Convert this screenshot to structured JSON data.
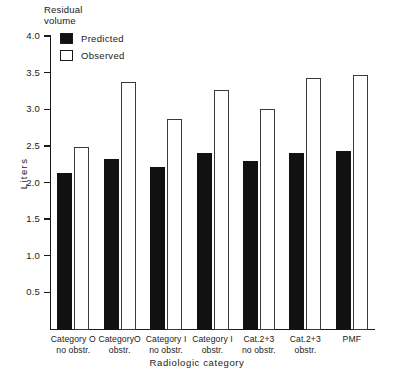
{
  "chart_data": {
    "type": "bar",
    "title": "Residual volume",
    "xlabel": "Radiologic category",
    "ylabel": "Liters",
    "ylim": [
      0,
      4.0
    ],
    "yticks": [
      "0.5",
      "1.0",
      "1.5",
      "2.0",
      "2.5",
      "3.0",
      "3.5",
      "4.0"
    ],
    "ytick_values": [
      0.5,
      1.0,
      1.5,
      2.0,
      2.5,
      3.0,
      3.5,
      4.0
    ],
    "grid": false,
    "legend_position": "upper-left",
    "categories": [
      "Category O\nno obstr.",
      "CategoryO\nobstr.",
      "Category I\nno obstr.",
      "Category I\nobstr.",
      "Cat.2+3\nno obstr.",
      "Cat.2+3\nobstr.",
      "PMF"
    ],
    "series": [
      {
        "name": "Predicted",
        "color": "#111111",
        "style": "filled",
        "values": [
          2.15,
          2.33,
          2.22,
          2.42,
          2.31,
          2.42,
          2.45
        ]
      },
      {
        "name": "Observed",
        "color": "#ffffff",
        "style": "open",
        "values": [
          2.5,
          3.38,
          2.88,
          3.27,
          3.02,
          3.44,
          3.48
        ]
      }
    ]
  },
  "axis_title_top": "Residual\nvolume",
  "legend": {
    "items": [
      {
        "label": "Predicted",
        "swatch": "filled-square"
      },
      {
        "label": "Observed",
        "swatch": "open-square"
      }
    ]
  }
}
